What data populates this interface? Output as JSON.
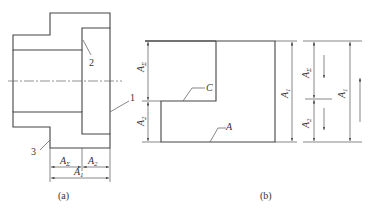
{
  "figure_a": {
    "caption": "(a)",
    "part_labels": {
      "p1": "1",
      "p2": "2",
      "p3": "3"
    },
    "dims": {
      "a_sigma": "A",
      "a_sigma_sub": "Σ",
      "a2": "A",
      "a2_sub": "2",
      "a1": "A",
      "a1_sub": "1"
    }
  },
  "figure_b": {
    "caption": "(b)",
    "surface_labels": {
      "c": "C",
      "a": "A"
    },
    "dims": {
      "a_sigma": "A",
      "a_sigma_sub": "Σ",
      "a2": "A",
      "a2_sub": "2",
      "a1": "A",
      "a1_sub": "1"
    },
    "chain": {
      "a_sigma": "A",
      "a_sigma_sub": "Σ",
      "a2": "A",
      "a2_sub": "2",
      "a1": "A",
      "a1_sub": "1"
    }
  }
}
